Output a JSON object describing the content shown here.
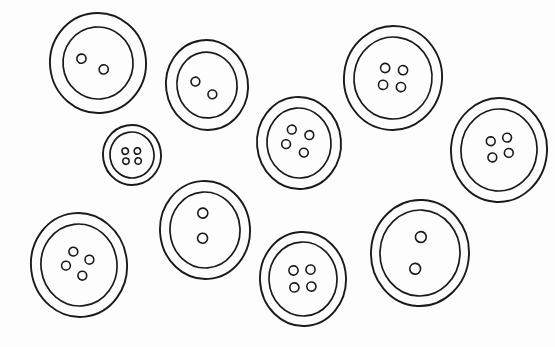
{
  "image": {
    "title": "Buttons line drawing",
    "style": "black-and-white line art / coloring page",
    "background_color": "#fdfdfd",
    "stroke_color": "#1a1a1a",
    "width": 555,
    "height": 347,
    "object_count": 10,
    "object_name": "sewing button"
  },
  "buttons": [
    {
      "id": "button-top-left",
      "label": "Large two-hole button, top left",
      "cx": 98,
      "cy": 63,
      "outer_rx": 48,
      "outer_ry": 50,
      "inner_rx": 35,
      "inner_ry": 36,
      "rotation": -6,
      "hole_count": 2,
      "hole_r": 4.6,
      "holes": [
        {
          "dx": -16,
          "dy": -6
        },
        {
          "dx": 5,
          "dy": 7
        }
      ]
    },
    {
      "id": "button-top-center",
      "label": "Two-hole button, top center",
      "cx": 207,
      "cy": 85,
      "outer_rx": 41,
      "outer_ry": 45,
      "inner_rx": 30,
      "inner_ry": 33,
      "rotation": -8,
      "hole_count": 2,
      "hole_r": 4.4,
      "holes": [
        {
          "dx": -11,
          "dy": -5
        },
        {
          "dx": 4,
          "dy": 10
        }
      ]
    },
    {
      "id": "button-small-center-left",
      "label": "Small four-hole button, center left",
      "cx": 132,
      "cy": 155,
      "outer_rx": 29,
      "outer_ry": 30,
      "inner_rx": 22,
      "inner_ry": 23,
      "rotation": -10,
      "hole_count": 4,
      "hole_r": 3.2,
      "holes": [
        {
          "dx": -6,
          "dy": -5
        },
        {
          "dx": 6,
          "dy": -3
        },
        {
          "dx": -7,
          "dy": 5
        },
        {
          "dx": 5,
          "dy": 7
        }
      ]
    },
    {
      "id": "button-center",
      "label": "Four-hole button, center",
      "cx": 299,
      "cy": 143,
      "outer_rx": 42,
      "outer_ry": 46,
      "inner_rx": 32,
      "inner_ry": 35,
      "rotation": -5,
      "hole_count": 4,
      "hole_r": 4.4,
      "holes": [
        {
          "dx": -6,
          "dy": -14
        },
        {
          "dx": 11,
          "dy": -7
        },
        {
          "dx": -13,
          "dy": 0
        },
        {
          "dx": 4,
          "dy": 10
        }
      ]
    },
    {
      "id": "button-top-right",
      "label": "Large four-hole button, top right",
      "cx": 393,
      "cy": 78,
      "outer_rx": 49,
      "outer_ry": 52,
      "inner_rx": 39,
      "inner_ry": 41,
      "rotation": 7,
      "hole_count": 4,
      "hole_r": 4.6,
      "holes": [
        {
          "dx": -9,
          "dy": -9
        },
        {
          "dx": 9,
          "dy": -9
        },
        {
          "dx": -9,
          "dy": 8
        },
        {
          "dx": 9,
          "dy": 8
        }
      ]
    },
    {
      "id": "button-right-edge",
      "label": "Four-hole button, right edge",
      "cx": 499,
      "cy": 150,
      "outer_rx": 48,
      "outer_ry": 52,
      "inner_rx": 38,
      "inner_ry": 41,
      "rotation": 5,
      "hole_count": 4,
      "hole_r": 4.4,
      "holes": [
        {
          "dx": -9,
          "dy": -8
        },
        {
          "dx": 7,
          "dy": -13
        },
        {
          "dx": -6,
          "dy": 8
        },
        {
          "dx": 10,
          "dy": 2
        }
      ]
    },
    {
      "id": "button-bottom-left",
      "label": "Four-hole button, bottom left",
      "cx": 79,
      "cy": 265,
      "outer_rx": 48,
      "outer_ry": 52,
      "inner_rx": 38,
      "inner_ry": 41,
      "rotation": -7,
      "hole_count": 4,
      "hole_r": 4.4,
      "holes": [
        {
          "dx": -4,
          "dy": -14
        },
        {
          "dx": 11,
          "dy": -4
        },
        {
          "dx": -13,
          "dy": -1
        },
        {
          "dx": 2,
          "dy": 11
        }
      ]
    },
    {
      "id": "button-bottom-center-left",
      "label": "Two-hole button, lower center left",
      "cx": 205,
      "cy": 230,
      "outer_rx": 45,
      "outer_ry": 49,
      "inner_rx": 35,
      "inner_ry": 38,
      "rotation": -4,
      "hole_count": 2,
      "hole_r": 5.0,
      "holes": [
        {
          "dx": -1,
          "dy": -17
        },
        {
          "dx": -3,
          "dy": 8
        }
      ]
    },
    {
      "id": "button-bottom-center",
      "label": "Four-hole button, bottom center",
      "cx": 303,
      "cy": 279,
      "outer_rx": 43,
      "outer_ry": 47,
      "inner_rx": 34,
      "inner_ry": 37,
      "rotation": -3,
      "hole_count": 4,
      "hole_r": 4.6,
      "holes": [
        {
          "dx": -9,
          "dy": -9
        },
        {
          "dx": 8,
          "dy": -9
        },
        {
          "dx": -9,
          "dy": 8
        },
        {
          "dx": 8,
          "dy": 8
        }
      ]
    },
    {
      "id": "button-bottom-right",
      "label": "Large two-hole button, bottom right",
      "cx": 420,
      "cy": 253,
      "outer_rx": 49,
      "outer_ry": 53,
      "inner_rx": 40,
      "inner_ry": 43,
      "rotation": 3,
      "hole_count": 2,
      "hole_r": 5.4,
      "holes": [
        {
          "dx": 0,
          "dy": -16
        },
        {
          "dx": -4,
          "dy": 16
        }
      ]
    }
  ]
}
